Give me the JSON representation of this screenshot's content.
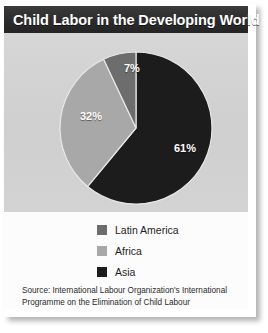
{
  "title": "Child Labor in the Developing World",
  "chart_data": {
    "type": "pie",
    "title": "Child Labor in the Developing World",
    "categories": [
      "Latin America",
      "Africa",
      "Asia"
    ],
    "values": [
      7,
      32,
      61
    ],
    "value_labels": [
      "7%",
      "32%",
      "61%"
    ],
    "unit": "percent",
    "colors": [
      "#6d6d6d",
      "#a8a8a8",
      "#1c1c1c"
    ],
    "legend_position": "bottom",
    "grid": false,
    "start_angle_deg": 0,
    "direction": "clockwise",
    "slice_order_from_top_clockwise": [
      "Asia",
      "Africa",
      "Latin America"
    ],
    "source": "Source: International Labour Organization's International Programme on the Elimination of Child Labour"
  },
  "legend": {
    "items": [
      {
        "label": "Latin America",
        "color": "#6d6d6d",
        "value": "7%"
      },
      {
        "label": "Africa",
        "color": "#a8a8a8",
        "value": "32%"
      },
      {
        "label": "Asia",
        "color": "#1c1c1c",
        "value": "61%"
      }
    ]
  },
  "slice_labels": {
    "asia": "61%",
    "africa": "32%",
    "latin_america": "7%"
  },
  "source": {
    "line1": "Source: International Labour Organization's International",
    "line2": "Programme on the Elimination of Child Labour"
  },
  "theme": {
    "title_bar_bg": "#2b2b2b",
    "title_text": "#ffffff",
    "panel_bg": "#d2d2d2",
    "lower_bg": "#fcfcfc",
    "card_bg": "#ffffff",
    "label_text": "#1d1d1d"
  }
}
